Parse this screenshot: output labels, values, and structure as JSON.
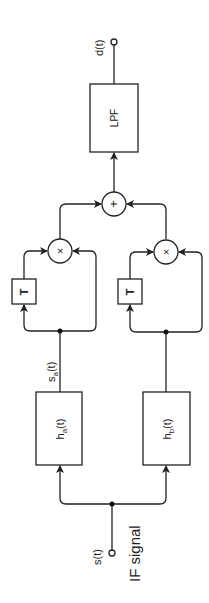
{
  "diagram": {
    "title": "",
    "orientation": "rotated -90deg",
    "nodes": {
      "input": {
        "label": "s(t)",
        "caption": "IF signal"
      },
      "output": {
        "label": "d(t)"
      },
      "filter_a": {
        "label": "h",
        "sub": "a",
        "arg": "(t)"
      },
      "filter_b": {
        "label": "h",
        "sub": "b",
        "arg": "(t)"
      },
      "signal_a": {
        "label": "s",
        "sub": "a",
        "arg": "(t)"
      },
      "delay_a": {
        "label": "T"
      },
      "delay_b": {
        "label": "T"
      },
      "mult_a": {
        "label": "×"
      },
      "mult_b": {
        "label": "×"
      },
      "summer": {
        "label": "+"
      },
      "lpf": {
        "label": "LPF"
      }
    },
    "edges": [
      [
        "s(t)",
        "h_a(t)"
      ],
      [
        "s(t)",
        "h_b(t)"
      ],
      [
        "h_a(t)",
        "T_a"
      ],
      [
        "h_a(t)",
        "mult_a"
      ],
      [
        "T_a",
        "mult_a"
      ],
      [
        "h_b(t)",
        "T_b"
      ],
      [
        "h_b(t)",
        "mult_b"
      ],
      [
        "T_b",
        "mult_b"
      ],
      [
        "mult_a",
        "summer"
      ],
      [
        "mult_b",
        "summer"
      ],
      [
        "summer",
        "LPF"
      ],
      [
        "LPF",
        "d(t)"
      ]
    ]
  }
}
